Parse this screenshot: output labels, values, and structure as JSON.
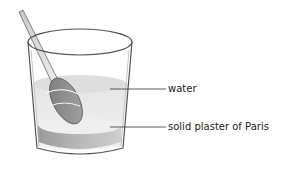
{
  "figure": {
    "labels": [
      {
        "id": "water",
        "text": "water"
      },
      {
        "id": "plaster",
        "text": "solid plaster of Paris"
      }
    ],
    "colors": {
      "outline": "#555555",
      "water": "#e6e6e6",
      "water_surface": "#d9d9d9",
      "plaster_top": "#ececec",
      "plaster_side": "#a9a9a9",
      "spoon_bowl": "#8c8c8c",
      "spoon_handle": "#d0d0d0"
    }
  }
}
